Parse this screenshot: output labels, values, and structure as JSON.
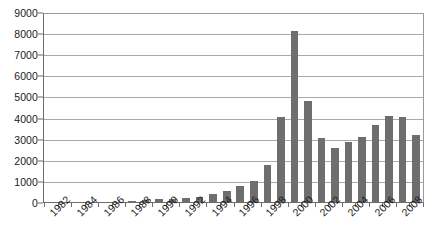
{
  "chart_data": {
    "type": "bar",
    "title": "",
    "subtitle": "",
    "xlabel": "",
    "ylabel": "",
    "ylim": [
      0,
      9000
    ],
    "ytick_step": 1000,
    "ytick_labels": [
      "0",
      "1000",
      "2000",
      "3000",
      "4000",
      "5000",
      "6000",
      "7000",
      "8000",
      "9000"
    ],
    "ytick_values": [
      0,
      1000,
      2000,
      3000,
      4000,
      5000,
      6000,
      7000,
      8000,
      9000
    ],
    "grid": true,
    "grid_axis": "y",
    "legend": false,
    "legend_position": "none",
    "label_rotation": -45,
    "xtick_labels_shown": [
      "1982",
      "1984",
      "1986",
      "1988",
      "1990",
      "1992",
      "1994",
      "1996",
      "1998",
      "2000",
      "2002",
      "2004",
      "2006",
      "2008"
    ],
    "categories": [
      "1982",
      "1983",
      "1984",
      "1985",
      "1986",
      "1987",
      "1988",
      "1989",
      "1990",
      "1991",
      "1992",
      "1993",
      "1994",
      "1995",
      "1996",
      "1997",
      "1998",
      "1999",
      "2000",
      "2001",
      "2002",
      "2003",
      "2004",
      "2005",
      "2006",
      "2007",
      "2008",
      "2009"
    ],
    "values": [
      10,
      15,
      25,
      30,
      55,
      60,
      75,
      150,
      170,
      200,
      215,
      290,
      430,
      570,
      820,
      1040,
      1800,
      4080,
      8130,
      4820,
      3060,
      2620,
      2890,
      3110,
      3690,
      4110,
      4080,
      3220
    ],
    "series": [
      {
        "name": "",
        "color": "#6e6e6e",
        "values": [
          10,
          15,
          25,
          30,
          55,
          60,
          75,
          150,
          170,
          200,
          215,
          290,
          430,
          570,
          820,
          1040,
          1800,
          4080,
          8130,
          4820,
          3060,
          2620,
          2890,
          3110,
          3690,
          4110,
          4080,
          3220
        ]
      }
    ]
  },
  "style": {
    "bar_color": "#6e6e6e",
    "grid_color": "#a9a9a9",
    "axis_color": "#6d6d6d",
    "frame_color": "#9a9a9a",
    "background": "#ffffff",
    "text_color": "#1a1a1a"
  }
}
